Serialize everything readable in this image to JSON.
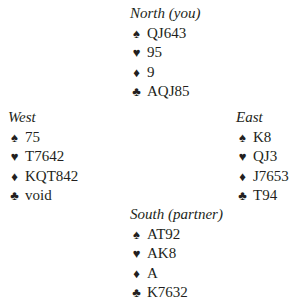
{
  "hands": {
    "north": {
      "title": "North (you)",
      "suits": [
        {
          "icon": "♠",
          "name": "spades",
          "cards": "QJ643"
        },
        {
          "icon": "♥",
          "name": "hearts",
          "cards": "95"
        },
        {
          "icon": "♦",
          "name": "diamonds",
          "cards": "9"
        },
        {
          "icon": "♣",
          "name": "clubs",
          "cards": "AQJ85"
        }
      ]
    },
    "west": {
      "title": "West",
      "suits": [
        {
          "icon": "♠",
          "name": "spades",
          "cards": "75"
        },
        {
          "icon": "♥",
          "name": "hearts",
          "cards": "T7642"
        },
        {
          "icon": "♦",
          "name": "diamonds",
          "cards": "KQT842"
        },
        {
          "icon": "♣",
          "name": "clubs",
          "cards": "void"
        }
      ]
    },
    "east": {
      "title": "East",
      "suits": [
        {
          "icon": "♠",
          "name": "spades",
          "cards": "K8"
        },
        {
          "icon": "♥",
          "name": "hearts",
          "cards": "QJ3"
        },
        {
          "icon": "♦",
          "name": "diamonds",
          "cards": "J7653"
        },
        {
          "icon": "♣",
          "name": "clubs",
          "cards": "T94"
        }
      ]
    },
    "south": {
      "title": "South (partner)",
      "suits": [
        {
          "icon": "♠",
          "name": "spades",
          "cards": "AT92"
        },
        {
          "icon": "♥",
          "name": "hearts",
          "cards": "AK8"
        },
        {
          "icon": "♦",
          "name": "diamonds",
          "cards": "A"
        },
        {
          "icon": "♣",
          "name": "clubs",
          "cards": "K7632"
        }
      ]
    }
  }
}
